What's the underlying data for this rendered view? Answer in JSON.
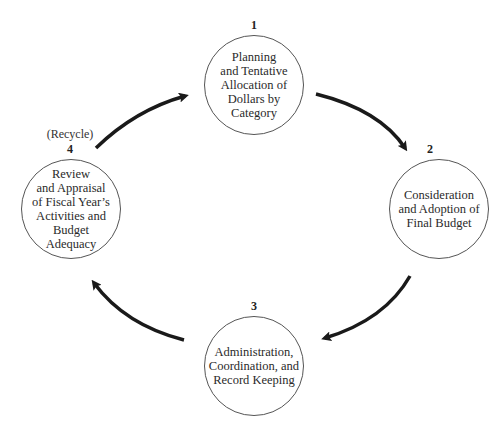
{
  "diagram": {
    "type": "cycle",
    "nodes": [
      {
        "id": 1,
        "number": "1",
        "label": "Planning\nand Tentative\nAllocation of\nDollars by\nCategory"
      },
      {
        "id": 2,
        "number": "2",
        "label": "Consideration\nand Adoption of\nFinal Budget"
      },
      {
        "id": 3,
        "number": "3",
        "label": "Administration,\nCoordination, and\nRecord Keeping"
      },
      {
        "id": 4,
        "number": "4",
        "label": "Review\nand Appraisal\nof Fiscal Year’s\nActivities and\nBudget\nAdequacy",
        "note": "(Recycle)"
      }
    ],
    "edges": [
      {
        "from": 1,
        "to": 2
      },
      {
        "from": 2,
        "to": 3
      },
      {
        "from": 3,
        "to": 4
      },
      {
        "from": 4,
        "to": 1
      }
    ],
    "colors": {
      "arrow": "#1a1a1a",
      "circle_border": "#555555",
      "background": "#ffffff"
    }
  }
}
